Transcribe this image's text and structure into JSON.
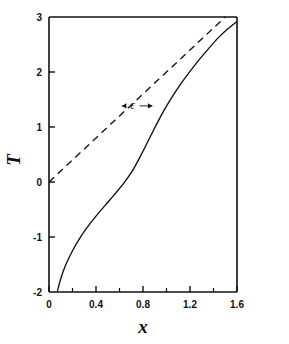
{
  "chart_data": {
    "type": "line",
    "title": "",
    "xlabel": "x",
    "ylabel": "T",
    "xlim": [
      0,
      1.6
    ],
    "ylim": [
      -2,
      3
    ],
    "grid": false,
    "legend": null,
    "x_ticks_major": [
      0,
      0.4,
      0.8,
      1.2,
      1.6
    ],
    "x_tick_labels": [
      "0",
      "0.4",
      "0.8",
      "1.2",
      "1.6"
    ],
    "x_ticks_minor": [
      0.2,
      0.6,
      1.0,
      1.4
    ],
    "y_ticks_major": [
      -2,
      -1,
      0,
      1,
      2,
      3
    ],
    "y_tick_labels": [
      "-2",
      "-1",
      "0",
      "1",
      "2",
      "3"
    ],
    "series": [
      {
        "name": "solid-curve",
        "style": "solid",
        "color": "#111111",
        "x": [
          0.07,
          0.1,
          0.14,
          0.2,
          0.26,
          0.32,
          0.4,
          0.48,
          0.56,
          0.64,
          0.72,
          0.8,
          0.88,
          0.96,
          1.04,
          1.12,
          1.2,
          1.28,
          1.36,
          1.44,
          1.52,
          1.6
        ],
        "y": [
          -2.0,
          -1.76,
          -1.52,
          -1.25,
          -1.03,
          -0.84,
          -0.62,
          -0.42,
          -0.22,
          -0.01,
          0.24,
          0.56,
          0.9,
          1.23,
          1.52,
          1.78,
          2.01,
          2.23,
          2.43,
          2.62,
          2.78,
          2.92
        ]
      },
      {
        "name": "dashed-line",
        "style": "dashed",
        "color": "#111111",
        "x": [
          0.0,
          1.5
        ],
        "y": [
          0.0,
          3.0
        ]
      }
    ],
    "annotations": [
      {
        "name": "epsilon-gap",
        "label": "ε",
        "x": 0.72,
        "y": 1.32,
        "arrow_left_x": 0.62,
        "arrow_right_x": 0.88,
        "description": "double arrow marking horizontal gap epsilon between dashed line and solid curve"
      }
    ]
  }
}
